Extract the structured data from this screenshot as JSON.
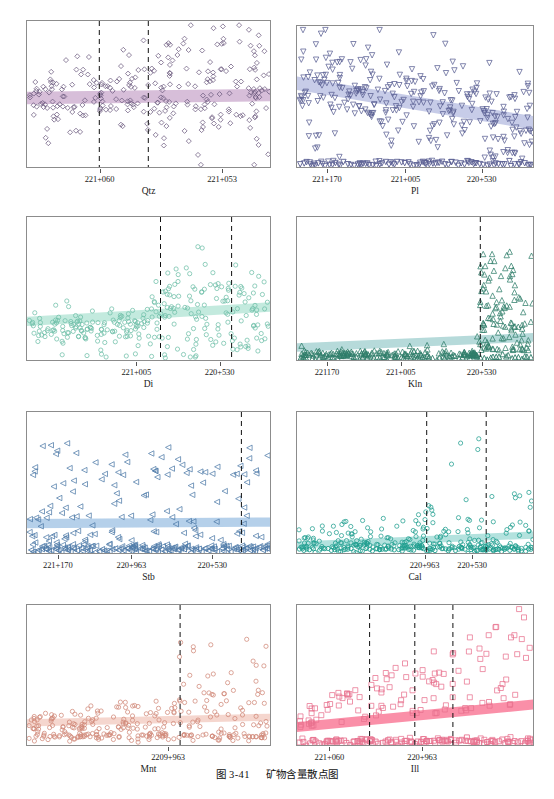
{
  "caption": {
    "number": "图 3-41",
    "text": "矿物含量散点图"
  },
  "figure": {
    "width": 554,
    "height": 799,
    "background": "#ffffff",
    "frame_color": "#8c8c8c"
  },
  "chart_data": [
    {
      "type": "scatter",
      "title": "Qtz",
      "xlabel": "",
      "ylabel": "",
      "marker": "diamond",
      "marker_color": "#6b5a7e",
      "band_color": "#c9a8cc",
      "band_opacity": 0.75,
      "grid": false,
      "legend": false,
      "panel": {
        "x": 26,
        "y": 20,
        "w": 245,
        "h": 148
      },
      "xticks": [
        {
          "label": "221+060",
          "pos": 0.3
        },
        {
          "label": "221+053",
          "pos": 0.8
        }
      ],
      "vlines": [
        0.295,
        0.495
      ],
      "band": {
        "y0": 0.52,
        "y1": 0.5,
        "thickness": 0.085
      },
      "n_points": 268,
      "seed": 11,
      "distribution": "dense-midband-upper-right",
      "baseline_cluster": false
    },
    {
      "type": "scatter",
      "title": "Pl",
      "xlabel": "",
      "ylabel": "",
      "marker": "triangle-down",
      "marker_color": "#5a5f93",
      "band_color": "#b9bfe2",
      "band_opacity": 0.8,
      "grid": false,
      "legend": false,
      "panel": {
        "x": 296,
        "y": 25,
        "w": 238,
        "h": 143
      },
      "xticks": [
        {
          "label": "221+170",
          "pos": 0.13
        },
        {
          "label": "221+005",
          "pos": 0.46
        },
        {
          "label": "220+530",
          "pos": 0.78
        }
      ],
      "vlines": [],
      "band": {
        "y0": 0.4,
        "y1": 0.68,
        "thickness": 0.095
      },
      "n_points": 300,
      "seed": 23,
      "distribution": "declining-trend",
      "baseline_cluster": true
    },
    {
      "type": "scatter",
      "title": "Di",
      "xlabel": "",
      "ylabel": "",
      "marker": "circle",
      "marker_color": "#6fbfa8",
      "band_color": "#b9e6d8",
      "band_opacity": 0.85,
      "grid": false,
      "legend": false,
      "panel": {
        "x": 26,
        "y": 216,
        "w": 245,
        "h": 145
      },
      "xticks": [
        {
          "label": "221+005",
          "pos": 0.45
        },
        {
          "label": "220+530",
          "pos": 0.79
        }
      ],
      "vlines": [
        0.545,
        0.835
      ],
      "band": {
        "y0": 0.72,
        "y1": 0.62,
        "thickness": 0.065
      },
      "n_points": 290,
      "seed": 37,
      "distribution": "low-left-rising-right",
      "baseline_cluster": false
    },
    {
      "type": "scatter",
      "title": "Kln",
      "xlabel": "",
      "ylabel": "",
      "marker": "triangle-up",
      "marker_color": "#2f7d6a",
      "band_color": "#a9d4d4",
      "band_opacity": 0.85,
      "grid": false,
      "legend": false,
      "panel": {
        "x": 296,
        "y": 216,
        "w": 238,
        "h": 145
      },
      "xticks": [
        {
          "label": "221170",
          "pos": 0.13
        },
        {
          "label": "221+005",
          "pos": 0.44
        },
        {
          "label": "220+530",
          "pos": 0.78
        }
      ],
      "vlines": [
        0.77
      ],
      "band": {
        "y0": 0.9,
        "y1": 0.83,
        "thickness": 0.06
      },
      "n_points": 250,
      "seed": 53,
      "distribution": "flat-baseline-spike-right",
      "baseline_cluster": true
    },
    {
      "type": "scatter",
      "title": "Stb",
      "xlabel": "",
      "ylabel": "",
      "marker": "triangle-left",
      "marker_color": "#4f7ba8",
      "band_color": "#a8c8e6",
      "band_opacity": 0.85,
      "grid": false,
      "legend": false,
      "panel": {
        "x": 26,
        "y": 411,
        "w": 245,
        "h": 143
      },
      "xticks": [
        {
          "label": "221+170",
          "pos": 0.13
        },
        {
          "label": "220+963",
          "pos": 0.43
        },
        {
          "label": "220+530",
          "pos": 0.76
        }
      ],
      "vlines": [
        0.875
      ],
      "band": {
        "y0": 0.78,
        "y1": 0.77,
        "thickness": 0.065
      },
      "n_points": 210,
      "seed": 71,
      "distribution": "scattered-with-baseline",
      "baseline_cluster": true
    },
    {
      "type": "scatter",
      "title": "Cal",
      "xlabel": "",
      "ylabel": "",
      "marker": "circle",
      "marker_color": "#1f9e8f",
      "band_color": "#a6ddd8",
      "band_opacity": 0.85,
      "grid": false,
      "legend": false,
      "panel": {
        "x": 296,
        "y": 411,
        "w": 238,
        "h": 143
      },
      "xticks": [
        {
          "label": "220+963",
          "pos": 0.54
        },
        {
          "label": "220+530",
          "pos": 0.74
        }
      ],
      "vlines": [
        0.545,
        0.795
      ],
      "band": {
        "y0": 0.93,
        "y1": 0.86,
        "thickness": 0.05
      },
      "n_points": 265,
      "seed": 89,
      "distribution": "baseline-with-right-spike",
      "baseline_cluster": true
    },
    {
      "type": "scatter",
      "title": "Mnt",
      "xlabel": "",
      "ylabel": "",
      "marker": "circle",
      "marker_color": "#d08878",
      "band_color": "#f3cfc6",
      "band_opacity": 0.85,
      "grid": false,
      "legend": false,
      "panel": {
        "x": 26,
        "y": 604,
        "w": 245,
        "h": 142
      },
      "xticks": [
        {
          "label": "2209+963",
          "pos": 0.58
        }
      ],
      "vlines": [
        0.625
      ],
      "band": {
        "y0": 0.83,
        "y1": 0.79,
        "thickness": 0.05
      },
      "n_points": 300,
      "seed": 101,
      "distribution": "low-dense-right-rise",
      "baseline_cluster": false
    },
    {
      "type": "scatter",
      "title": "Ill",
      "xlabel": "",
      "ylabel": "",
      "marker": "square",
      "marker_color": "#e8728f",
      "band_color": "#f9839f",
      "band_opacity": 0.9,
      "grid": false,
      "legend": false,
      "panel": {
        "x": 296,
        "y": 604,
        "w": 238,
        "h": 142
      },
      "xticks": [
        {
          "label": "221+060",
          "pos": 0.14
        },
        {
          "label": "220+963",
          "pos": 0.53
        }
      ],
      "vlines": [
        0.305,
        0.495,
        0.655
      ],
      "band": {
        "y0": 0.86,
        "y1": 0.7,
        "thickness": 0.07
      },
      "n_points": 175,
      "seed": 127,
      "distribution": "rising-trend-with-baseline",
      "baseline_cluster": true
    }
  ]
}
